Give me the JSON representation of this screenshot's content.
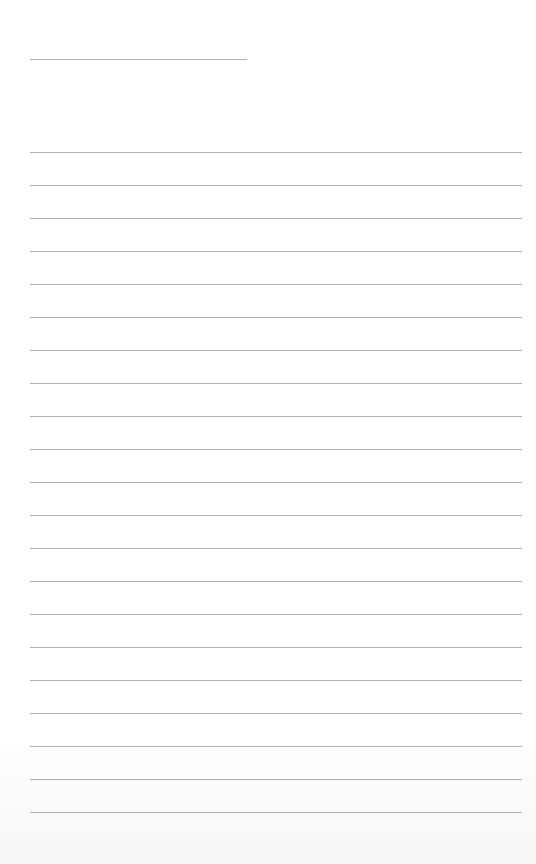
{
  "paper": {
    "type": "lined-notepaper",
    "background_color": "#ffffff",
    "line_color": "#b0b0b0",
    "header_line": {
      "x": 30,
      "y": 59,
      "width": 217
    },
    "ruled_lines": {
      "count": 21,
      "x": 30,
      "width": 492,
      "first_y": 152,
      "spacing": 33
    }
  }
}
